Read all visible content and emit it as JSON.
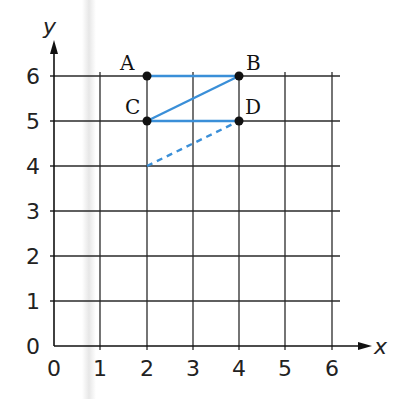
{
  "diagram": {
    "type": "coordinate-grid",
    "x_axis": {
      "label": "x",
      "ticks": [
        "0",
        "1",
        "2",
        "3",
        "4",
        "5",
        "6"
      ]
    },
    "y_axis": {
      "label": "y",
      "ticks": [
        "0",
        "1",
        "2",
        "3",
        "4",
        "5",
        "6"
      ]
    },
    "points": [
      {
        "name": "A",
        "x": 2,
        "y": 6
      },
      {
        "name": "B",
        "x": 4,
        "y": 6
      },
      {
        "name": "C",
        "x": 2,
        "y": 5
      },
      {
        "name": "D",
        "x": 4,
        "y": 5
      }
    ],
    "segments": [
      {
        "from": "A",
        "to": "B",
        "style": "solid"
      },
      {
        "from": "C",
        "to": "B",
        "style": "solid"
      },
      {
        "from": "C",
        "to": "D",
        "style": "solid"
      },
      {
        "from": [
          2,
          4
        ],
        "to": [
          4,
          5
        ],
        "style": "dashed"
      }
    ],
    "colors": {
      "line": "#3a8fd8",
      "grid": "#222222",
      "point": "#111111"
    }
  }
}
